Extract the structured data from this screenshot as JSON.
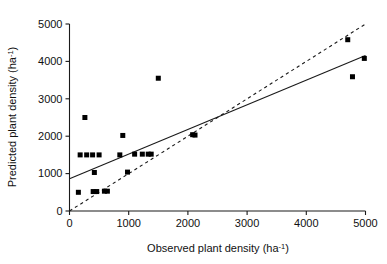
{
  "chart_data": {
    "type": "scatter",
    "title": "",
    "xlabel": "Observed plant density (ha-1)",
    "ylabel": "Predicted plant density (ha-1)",
    "xlabel_base": "Observed plant density (ha",
    "ylabel_base": "Predicted plant density (ha",
    "label_superscript": "-1",
    "label_close": ")",
    "xlim": [
      0,
      5000
    ],
    "ylim": [
      0,
      5000
    ],
    "xticks": [
      0,
      1000,
      2000,
      3000,
      4000,
      5000
    ],
    "yticks": [
      0,
      1000,
      2000,
      3000,
      4000,
      5000
    ],
    "xticklabels": [
      "0",
      "1000",
      "2000",
      "3000",
      "4000",
      "5000"
    ],
    "yticklabels": [
      "0",
      "1000",
      "2000",
      "3000",
      "4000",
      "5000"
    ],
    "grid": false,
    "legend": "none",
    "marker_style": "filled-square",
    "points": [
      {
        "x": 150,
        "y": 500
      },
      {
        "x": 180,
        "y": 1500
      },
      {
        "x": 260,
        "y": 2500
      },
      {
        "x": 290,
        "y": 1500
      },
      {
        "x": 390,
        "y": 1500
      },
      {
        "x": 400,
        "y": 520
      },
      {
        "x": 420,
        "y": 1030
      },
      {
        "x": 460,
        "y": 520
      },
      {
        "x": 500,
        "y": 1500
      },
      {
        "x": 590,
        "y": 530
      },
      {
        "x": 640,
        "y": 530
      },
      {
        "x": 850,
        "y": 1500
      },
      {
        "x": 900,
        "y": 2020
      },
      {
        "x": 980,
        "y": 1040
      },
      {
        "x": 1100,
        "y": 1520
      },
      {
        "x": 1230,
        "y": 1520
      },
      {
        "x": 1330,
        "y": 1520
      },
      {
        "x": 1380,
        "y": 1520
      },
      {
        "x": 1500,
        "y": 3550
      },
      {
        "x": 2080,
        "y": 2040
      },
      {
        "x": 2120,
        "y": 2030
      },
      {
        "x": 4700,
        "y": 4580
      },
      {
        "x": 4780,
        "y": 3590
      },
      {
        "x": 4980,
        "y": 4080
      }
    ],
    "lines": [
      {
        "name": "regression-fit",
        "style": "solid",
        "x0": 0,
        "y0": 860,
        "x1": 5000,
        "y1": 4160
      },
      {
        "name": "one-to-one-reference",
        "style": "dashed",
        "x0": 0,
        "y0": 0,
        "x1": 5000,
        "y1": 5000
      }
    ]
  }
}
